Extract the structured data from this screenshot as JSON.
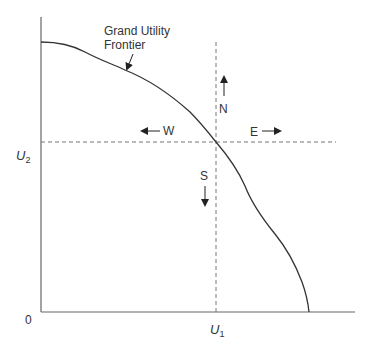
{
  "diagram": {
    "title": "Grand Utility Frontier",
    "curve_label_line1": "Grand Utility",
    "curve_label_line2": "Frontier",
    "origin_label": "0",
    "x_axis_label": "U",
    "x_axis_sub": "1",
    "y_axis_label": "U",
    "y_axis_sub": "2",
    "directions": {
      "north": "N",
      "south": "S",
      "east": "E",
      "west": "W"
    },
    "colors": {
      "axis": "#666666",
      "curve": "#333333",
      "dashed": "#666666",
      "text": "#333333"
    }
  }
}
